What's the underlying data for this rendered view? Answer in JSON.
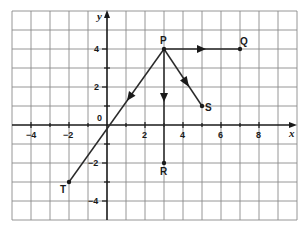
{
  "diagram": {
    "type": "coordinate-grid-vectors",
    "axes": {
      "x_label": "x",
      "y_label": "y",
      "x_ticks": [
        "−4",
        "−2",
        "2",
        "4",
        "6",
        "8"
      ],
      "y_ticks": [
        "4",
        "2",
        "−2",
        "−4"
      ],
      "origin_label": "0",
      "x_range": [
        -5,
        10
      ],
      "y_range": [
        -5,
        6
      ]
    },
    "points": [
      {
        "name": "P",
        "x": 3,
        "y": 4
      },
      {
        "name": "Q",
        "x": 7,
        "y": 4
      },
      {
        "name": "R",
        "x": 3,
        "y": -2
      },
      {
        "name": "S",
        "x": 5,
        "y": 1
      },
      {
        "name": "T",
        "x": -2,
        "y": -3
      }
    ],
    "vectors": [
      {
        "from": "P",
        "to": "Q"
      },
      {
        "from": "P",
        "to": "R"
      },
      {
        "from": "P",
        "to": "S"
      },
      {
        "from": "P",
        "to": "T"
      }
    ],
    "colors": {
      "grid": "#8a8a8a",
      "ink": "#1a1a1a",
      "background": "#ffffff"
    }
  }
}
